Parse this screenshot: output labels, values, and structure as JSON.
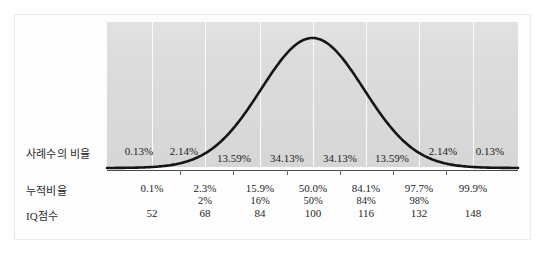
{
  "figure": {
    "panel_color": "#dcdcdc",
    "curve_color": "#1a1a1a",
    "gridline_color": "#fbfbfb"
  },
  "rows": {
    "proportion_label": "사례수의 비율",
    "cumulative_label": "누적비율",
    "iq_label": "IQ점수"
  },
  "chart_data": {
    "type": "area",
    "xlabel": "IQ점수",
    "ylabel": "",
    "grid": true,
    "legend": "none",
    "xlim": [
      36,
      164
    ],
    "ylim": [
      0,
      1
    ],
    "distribution": {
      "mean": 100,
      "sd": 16,
      "shape": "gaussian"
    },
    "band_categories": [
      "-4SD~-3SD",
      "-3SD~-2SD",
      "-2SD~-1SD",
      "-1SD~0SD",
      "0SD~+1SD",
      "+1SD~+2SD",
      "+2SD~+3SD",
      "+3SD~+4SD"
    ],
    "band_proportions": [
      "0.13%",
      "2.14%",
      "13.59%",
      "34.13%",
      "34.13%",
      "13.59%",
      "2.14%",
      "0.13%"
    ],
    "band_proportion_values": [
      0.13,
      2.14,
      13.59,
      34.13,
      34.13,
      13.59,
      2.14,
      0.13
    ],
    "boundary_iq_scores": [
      52,
      68,
      84,
      100,
      116,
      132,
      148
    ],
    "boundary_cumulative_exact": [
      "0.1%",
      "2.3%",
      "15.9%",
      "50.0%",
      "84.1%",
      "97.7%",
      "99.9%"
    ],
    "boundary_cumulative_exact_values": [
      0.1,
      2.3,
      15.9,
      50.0,
      84.1,
      97.7,
      99.9
    ],
    "boundary_cumulative_rounded": [
      "",
      "2%",
      "16%",
      "50%",
      "84%",
      "98%",
      ""
    ],
    "series": [
      {
        "name": "normal-curve",
        "x": [
          36,
          44,
          52,
          60,
          68,
          76,
          84,
          92,
          100,
          108,
          116,
          124,
          132,
          140,
          148,
          156,
          164
        ],
        "y": [
          0.0002,
          0.0019,
          0.011,
          0.044,
          0.135,
          0.325,
          0.607,
          0.882,
          1.0,
          0.882,
          0.607,
          0.325,
          0.135,
          0.044,
          0.011,
          0.0019,
          0.0002
        ]
      }
    ]
  },
  "proportion_cells": [
    {
      "text": "0.13%",
      "x": 139,
      "y": 145
    },
    {
      "text": "2.14%",
      "x": 184,
      "y": 145
    },
    {
      "text": "13.59%",
      "x": 234,
      "y": 152
    },
    {
      "text": "34.13%",
      "x": 287,
      "y": 152
    },
    {
      "text": "34.13%",
      "x": 340,
      "y": 152
    },
    {
      "text": "13.59%",
      "x": 392,
      "y": 152
    },
    {
      "text": "2.14%",
      "x": 443,
      "y": 145
    },
    {
      "text": "0.13%",
      "x": 490,
      "y": 145
    }
  ],
  "cumulative_cells": [
    {
      "text": "0.1%",
      "x": 152
    },
    {
      "text": "2.3%",
      "x": 205
    },
    {
      "text": "15.9%",
      "x": 260
    },
    {
      "text": "50.0%",
      "x": 313
    },
    {
      "text": "84.1%",
      "x": 366
    },
    {
      "text": "97.7%",
      "x": 419
    },
    {
      "text": "99.9%",
      "x": 473
    }
  ],
  "cumulative_rounded_cells": [
    {
      "text": "2%",
      "x": 205
    },
    {
      "text": "16%",
      "x": 260
    },
    {
      "text": "50%",
      "x": 313
    },
    {
      "text": "84%",
      "x": 366
    },
    {
      "text": "98%",
      "x": 419
    }
  ],
  "iq_cells": [
    {
      "text": "52",
      "x": 152
    },
    {
      "text": "68",
      "x": 205
    },
    {
      "text": "84",
      "x": 260
    },
    {
      "text": "100",
      "x": 313
    },
    {
      "text": "116",
      "x": 366
    },
    {
      "text": "132",
      "x": 419
    },
    {
      "text": "148",
      "x": 473
    }
  ],
  "gridlines_x": [
    152,
    205,
    260,
    313,
    366,
    419,
    473
  ],
  "ticks_x": [
    180,
    233,
    287,
    340,
    393,
    446
  ]
}
